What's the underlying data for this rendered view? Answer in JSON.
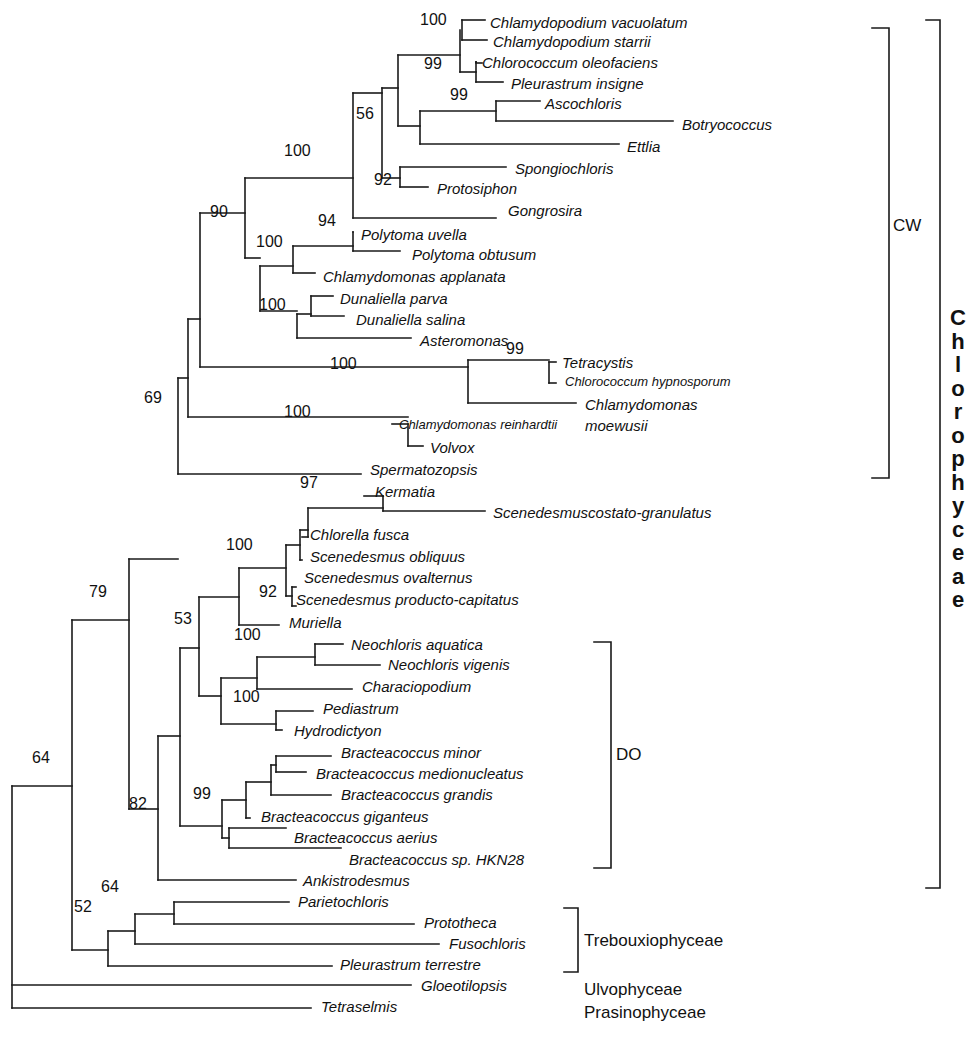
{
  "taxa": [
    {
      "name": "Chlamydopodium vacuolatum",
      "x": 490,
      "y": 28,
      "tip": 485
    },
    {
      "name": "Chlamydopodium starrii",
      "x": 493,
      "y": 47,
      "tip": 487
    },
    {
      "name": "Chlorococcum oleofaciens",
      "x": 482,
      "y": 68,
      "tip": 476
    },
    {
      "name": "Pleurastrum insigne",
      "x": 511,
      "y": 89,
      "tip": 503
    },
    {
      "name": "Ascochloris",
      "x": 545,
      "y": 109,
      "tip": 540
    },
    {
      "name": "Botryococcus",
      "x": 682,
      "y": 130,
      "tip": 673
    },
    {
      "name": "Ettlia",
      "x": 627,
      "y": 152,
      "tip": 619
    },
    {
      "name": "Spongiochloris",
      "x": 515,
      "y": 174,
      "tip": 506
    },
    {
      "name": "Protosiphon",
      "x": 437,
      "y": 194,
      "tip": 428
    },
    {
      "name": "Gongrosira",
      "x": 508,
      "y": 216,
      "tip": 496
    },
    {
      "name": "Polytoma uvella",
      "x": 361,
      "y": 240,
      "tip": 352
    },
    {
      "name": "Polytoma obtusum",
      "x": 412,
      "y": 260,
      "tip": 400
    },
    {
      "name": "Chlamydomonas applanata",
      "x": 323,
      "y": 282,
      "tip": 315
    },
    {
      "name": "Dunaliella parva",
      "x": 340,
      "y": 304,
      "tip": 333
    },
    {
      "name": "Dunaliella salina",
      "x": 356,
      "y": 325,
      "tip": 344
    },
    {
      "name": "Asteromonas",
      "x": 420,
      "y": 346,
      "tip": 411
    },
    {
      "name": "Tetracystis",
      "x": 562,
      "y": 368,
      "tip": 556
    },
    {
      "name": "Chlorococcum hypnosporum",
      "x": 565,
      "y": 388,
      "tip": 556,
      "small": true
    },
    {
      "name": "Chlamydomonas",
      "x": 585,
      "y": 410,
      "tip": 576
    },
    {
      "name": "moewusii",
      "x": 585,
      "y": 431,
      "tip": null
    },
    {
      "name": "Chlamydomonas  reinhardtii",
      "x": 399,
      "y": 431,
      "tip": 392,
      "small": true
    },
    {
      "name": "Volvox",
      "x": 430,
      "y": 453,
      "tip": 423
    },
    {
      "name": "Spermatozopsis",
      "x": 370,
      "y": 475,
      "tip": 361
    },
    {
      "name": "Kermatia",
      "x": 375,
      "y": 497,
      "tip": 364
    },
    {
      "name": "Scenedesmuscostato-granulatus",
      "x": 493,
      "y": 518,
      "tip": 485
    },
    {
      "name": "Chlorella  fusca",
      "x": 310,
      "y": 540,
      "tip": 302
    },
    {
      "name": "Scenedesmus obliquus",
      "x": 310,
      "y": 562,
      "tip": 302
    },
    {
      "name": "Scenedesmus ovalternus",
      "x": 304,
      "y": 583,
      "tip": 296
    },
    {
      "name": "Scenedesmus producto-capitatus",
      "x": 296,
      "y": 605,
      "tip": null
    },
    {
      "name": "Muriella",
      "x": 289,
      "y": 628,
      "tip": 279
    },
    {
      "name": "Neochloris aquatica",
      "x": 351,
      "y": 650,
      "tip": 343
    },
    {
      "name": "Neochloris vigenis",
      "x": 388,
      "y": 670,
      "tip": 380
    },
    {
      "name": "Characiopodium",
      "x": 362,
      "y": 692,
      "tip": 352
    },
    {
      "name": "Pediastrum",
      "x": 323,
      "y": 714,
      "tip": 313
    },
    {
      "name": "Hydrodictyon",
      "x": 294,
      "y": 736,
      "tip": null
    },
    {
      "name": "Bracteacoccus  minor",
      "x": 341,
      "y": 758,
      "tip": 331
    },
    {
      "name": "Bracteacoccus  medionucleatus",
      "x": 316,
      "y": 779,
      "tip": 306
    },
    {
      "name": "Bracteacoccus  grandis",
      "x": 341,
      "y": 800,
      "tip": 331
    },
    {
      "name": "Bracteacoccus  giganteus",
      "x": 261,
      "y": 822,
      "tip": null
    },
    {
      "name": "Bracteacoccus  aerius",
      "x": 294,
      "y": 843,
      "tip": 286
    },
    {
      "name": "Bracteacoccus sp. HKN28",
      "x": 349,
      "y": 865,
      "tip": 341
    },
    {
      "name": "Ankistrodesmus",
      "x": 303,
      "y": 886,
      "tip": 296
    },
    {
      "name": "Parietochloris",
      "x": 298,
      "y": 907,
      "tip": 289
    },
    {
      "name": "Prototheca",
      "x": 424,
      "y": 928,
      "tip": 414
    },
    {
      "name": "Fusochloris",
      "x": 449,
      "y": 949,
      "tip": 439
    },
    {
      "name": "Pleurastrum terrestre",
      "x": 340,
      "y": 970,
      "tip": 332
    },
    {
      "name": "Gloeotilopsis",
      "x": 421,
      "y": 991,
      "tip": 411
    },
    {
      "name": "Tetraselmis",
      "x": 321,
      "y": 1012,
      "tip": 311
    }
  ],
  "support_values": [
    {
      "value": "100",
      "x": 420,
      "y": 26
    },
    {
      "value": "99",
      "x": 424,
      "y": 70
    },
    {
      "value": "99",
      "x": 450,
      "y": 101
    },
    {
      "value": "56",
      "x": 356,
      "y": 120
    },
    {
      "value": "100",
      "x": 284,
      "y": 157
    },
    {
      "value": "92",
      "x": 374,
      "y": 186
    },
    {
      "value": "90",
      "x": 210,
      "y": 218
    },
    {
      "value": "94",
      "x": 318,
      "y": 227
    },
    {
      "value": "100",
      "x": 256,
      "y": 248
    },
    {
      "value": "100",
      "x": 259,
      "y": 311
    },
    {
      "value": "99",
      "x": 506,
      "y": 355
    },
    {
      "value": "100",
      "x": 330,
      "y": 370
    },
    {
      "value": "100",
      "x": 284,
      "y": 418
    },
    {
      "value": "69",
      "x": 144,
      "y": 404
    },
    {
      "value": "97",
      "x": 300,
      "y": 489
    },
    {
      "value": "100",
      "x": 226,
      "y": 551
    },
    {
      "value": "92",
      "x": 259,
      "y": 598
    },
    {
      "value": "79",
      "x": 89,
      "y": 598
    },
    {
      "value": "53",
      "x": 174,
      "y": 625
    },
    {
      "value": "100",
      "x": 234,
      "y": 641
    },
    {
      "value": "100",
      "x": 233,
      "y": 703
    },
    {
      "value": "64",
      "x": 32,
      "y": 764
    },
    {
      "value": "99",
      "x": 193,
      "y": 800
    },
    {
      "value": "82",
      "x": 129,
      "y": 810
    },
    {
      "value": "52",
      "x": 74,
      "y": 913
    },
    {
      "value": "64",
      "x": 101,
      "y": 893
    }
  ],
  "groups": {
    "cw": {
      "label": "CW",
      "x": 893,
      "y": 217
    },
    "do": {
      "label": "DO",
      "x": 616,
      "y": 746
    },
    "trebouxiophyceae": {
      "label": "Trebouxiophyceae",
      "x": 584,
      "y": 932
    },
    "ulvophyceae": {
      "label": "Ulvophyceae",
      "x": 584,
      "y": 981
    },
    "prasinophyceae": {
      "label": "Prasinophyceae",
      "x": 584,
      "y": 1004
    },
    "chlorophyceae": {
      "label": "Chlorophyceae",
      "letters": [
        "C",
        "h",
        "l",
        "o",
        "r",
        "o",
        "p",
        "h",
        "y",
        "c",
        "e",
        "a",
        "e"
      ]
    }
  },
  "brackets": [
    {
      "name": "cw-bracket",
      "x": 889,
      "y1": 28,
      "y2": 478,
      "w": 17
    },
    {
      "name": "chlorophyceae-bracket",
      "x": 940,
      "y1": 20,
      "y2": 888,
      "w": 14
    },
    {
      "name": "do-bracket",
      "x": 611,
      "y1": 642,
      "y2": 868,
      "w": 17
    },
    {
      "name": "trebouxiophyceae-bracket",
      "x": 578,
      "y1": 908,
      "y2": 972,
      "w": 14
    }
  ],
  "branches": [
    [
      462,
      20,
      462,
      40
    ],
    [
      462,
      20,
      485,
      20
    ],
    [
      462,
      40,
      487,
      40
    ],
    [
      476,
      62,
      476,
      82
    ],
    [
      476,
      62,
      476,
      62
    ],
    [
      476,
      62,
      476,
      62
    ],
    [
      460,
      30,
      460,
      72
    ],
    [
      460,
      72,
      476,
      72
    ],
    [
      476,
      63,
      482,
      63
    ],
    [
      476,
      82,
      503,
      82
    ],
    [
      398,
      55,
      460,
      55
    ],
    [
      496,
      101,
      496,
      121
    ],
    [
      496,
      101,
      540,
      101
    ],
    [
      496,
      121,
      673,
      121
    ],
    [
      420,
      111,
      420,
      144
    ],
    [
      420,
      111,
      496,
      111
    ],
    [
      420,
      144,
      619,
      144
    ],
    [
      398,
      55,
      398,
      126
    ],
    [
      398,
      126,
      420,
      126
    ],
    [
      400,
      167,
      400,
      187
    ],
    [
      400,
      167,
      506,
      167
    ],
    [
      400,
      187,
      428,
      187
    ],
    [
      382,
      88,
      382,
      178
    ],
    [
      382,
      88,
      398,
      88
    ],
    [
      382,
      178,
      400,
      178
    ],
    [
      353,
      93,
      353,
      218
    ],
    [
      353,
      93,
      382,
      93
    ],
    [
      353,
      218,
      496,
      218
    ],
    [
      353,
      232,
      353,
      251
    ],
    [
      353,
      232,
      353,
      232
    ],
    [
      353,
      251,
      400,
      251
    ],
    [
      293,
      246,
      293,
      273
    ],
    [
      293,
      246,
      353,
      246
    ],
    [
      293,
      273,
      315,
      273
    ],
    [
      311,
      296,
      311,
      316
    ],
    [
      311,
      296,
      333,
      296
    ],
    [
      311,
      316,
      344,
      316
    ],
    [
      297,
      314,
      297,
      338
    ],
    [
      297,
      314,
      311,
      314
    ],
    [
      297,
      338,
      411,
      338
    ],
    [
      260,
      266,
      260,
      311
    ],
    [
      260,
      266,
      293,
      266
    ],
    [
      260,
      311,
      297,
      311
    ],
    [
      245,
      178,
      245,
      258
    ],
    [
      245,
      178,
      353,
      178
    ],
    [
      245,
      258,
      260,
      258
    ],
    [
      549,
      362,
      549,
      383
    ],
    [
      549,
      362,
      556,
      362
    ],
    [
      549,
      383,
      556,
      383
    ],
    [
      468,
      360,
      468,
      403
    ],
    [
      468,
      360,
      549,
      360
    ],
    [
      468,
      403,
      576,
      403
    ],
    [
      200,
      213,
      200,
      367
    ],
    [
      200,
      213,
      245,
      213
    ],
    [
      200,
      367,
      468,
      367
    ],
    [
      408,
      424,
      408,
      446
    ],
    [
      408,
      424,
      392,
      424
    ],
    [
      408,
      446,
      423,
      446
    ],
    [
      188,
      319,
      188,
      417
    ],
    [
      188,
      319,
      200,
      319
    ],
    [
      188,
      417,
      408,
      417
    ],
    [
      178,
      378,
      178,
      474
    ],
    [
      178,
      378,
      188,
      378
    ],
    [
      178,
      474,
      361,
      474
    ],
    [
      383,
      496,
      383,
      511
    ],
    [
      383,
      496,
      364,
      496
    ],
    [
      383,
      511,
      485,
      511
    ],
    [
      308,
      508,
      308,
      537
    ],
    [
      308,
      508,
      383,
      508
    ],
    [
      308,
      537,
      302,
      537
    ],
    [
      300,
      530,
      300,
      560
    ],
    [
      300,
      530,
      308,
      530
    ],
    [
      300,
      560,
      302,
      560
    ],
    [
      292,
      587,
      292,
      606
    ],
    [
      292,
      587,
      296,
      587
    ],
    [
      292,
      606,
      296,
      606
    ],
    [
      286,
      545,
      286,
      596
    ],
    [
      286,
      545,
      300,
      545
    ],
    [
      286,
      596,
      292,
      596
    ],
    [
      239,
      568,
      239,
      625
    ],
    [
      239,
      568,
      286,
      568
    ],
    [
      239,
      625,
      279,
      625
    ],
    [
      315,
      644,
      315,
      665
    ],
    [
      315,
      644,
      343,
      644
    ],
    [
      315,
      665,
      380,
      665
    ],
    [
      257,
      657,
      257,
      689
    ],
    [
      257,
      657,
      315,
      657
    ],
    [
      257,
      689,
      352,
      689
    ],
    [
      276,
      711,
      276,
      730
    ],
    [
      276,
      711,
      313,
      711
    ],
    [
      276,
      730,
      282,
      730
    ],
    [
      221,
      678,
      221,
      724
    ],
    [
      221,
      678,
      257,
      678
    ],
    [
      221,
      724,
      276,
      724
    ],
    [
      276,
      756,
      276,
      772
    ],
    [
      276,
      756,
      331,
      756
    ],
    [
      276,
      772,
      306,
      772
    ],
    [
      271,
      765,
      271,
      795
    ],
    [
      271,
      765,
      276,
      765
    ],
    [
      271,
      795,
      331,
      795
    ],
    [
      246,
      782,
      246,
      818
    ],
    [
      246,
      782,
      271,
      782
    ],
    [
      246,
      818,
      250,
      818
    ],
    [
      229,
      828,
      229,
      848
    ],
    [
      229,
      828,
      286,
      828
    ],
    [
      229,
      848,
      341,
      848
    ],
    [
      222,
      800,
      222,
      838
    ],
    [
      222,
      800,
      246,
      800
    ],
    [
      222,
      838,
      229,
      838
    ],
    [
      199,
      597,
      199,
      696
    ],
    [
      199,
      597,
      239,
      597
    ],
    [
      199,
      696,
      221,
      696
    ],
    [
      180,
      648,
      180,
      826
    ],
    [
      180,
      648,
      199,
      648
    ],
    [
      180,
      826,
      222,
      826
    ],
    [
      158,
      736,
      158,
      880
    ],
    [
      158,
      736,
      180,
      736
    ],
    [
      158,
      880,
      296,
      880
    ],
    [
      129,
      559,
      129,
      809
    ],
    [
      129,
      559,
      178,
      559
    ],
    [
      129,
      809,
      158,
      809
    ],
    [
      174,
      902,
      174,
      924
    ],
    [
      174,
      902,
      289,
      902
    ],
    [
      174,
      924,
      414,
      924
    ],
    [
      135,
      914,
      135,
      944
    ],
    [
      135,
      914,
      174,
      914
    ],
    [
      135,
      944,
      439,
      944
    ],
    [
      108,
      931,
      108,
      966
    ],
    [
      108,
      931,
      135,
      931
    ],
    [
      108,
      966,
      332,
      966
    ],
    [
      72,
      620,
      72,
      950
    ],
    [
      72,
      620,
      129,
      620
    ],
    [
      72,
      950,
      108,
      950
    ],
    [
      12,
      786,
      12,
      1008
    ],
    [
      12,
      786,
      72,
      786
    ],
    [
      12,
      985,
      411,
      985
    ],
    [
      12,
      1008,
      311,
      1008
    ]
  ]
}
